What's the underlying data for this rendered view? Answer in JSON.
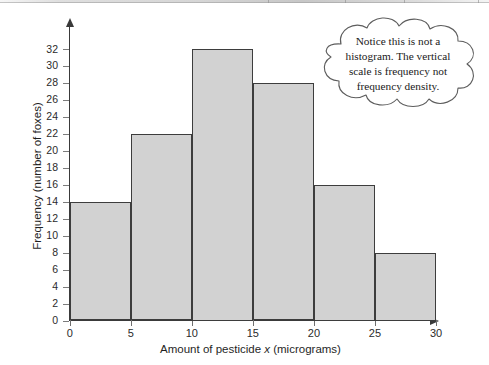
{
  "chart_data": {
    "type": "bar",
    "title": "",
    "xlabel_prefix": "Amount of pesticide ",
    "xlabel_italic": "x",
    "xlabel_suffix": " (micrograms)",
    "xlabel": "Amount of pesticide x (micrograms)",
    "ylabel": "Frequency (number of foxes)",
    "categories": [
      "0-5",
      "5-10",
      "10-15",
      "15-20",
      "20-25",
      "25-30"
    ],
    "bin_edges": [
      0,
      5,
      10,
      15,
      20,
      25,
      30
    ],
    "values": [
      14,
      22,
      32,
      28,
      16,
      8
    ],
    "xlim": [
      0,
      30
    ],
    "ylim": [
      0,
      32
    ],
    "x_ticks": [
      0,
      5,
      10,
      15,
      20,
      25,
      30
    ],
    "y_ticks": [
      0,
      2,
      4,
      6,
      8,
      10,
      12,
      14,
      16,
      18,
      20,
      22,
      24,
      26,
      28,
      30,
      32
    ],
    "grid": false,
    "legend": false,
    "bar_fill_color": "#d2d2d2",
    "bar_edge_color": "#3d3d3d",
    "axis_color": "#3a3a3a"
  },
  "callout": {
    "text": "Notice this is not a histogram. The vertical scale is frequency not frequency density.",
    "line1": "Notice this is not a",
    "line2": "histogram. The vertical",
    "line3": "scale is frequency not",
    "line4": "frequency density."
  }
}
